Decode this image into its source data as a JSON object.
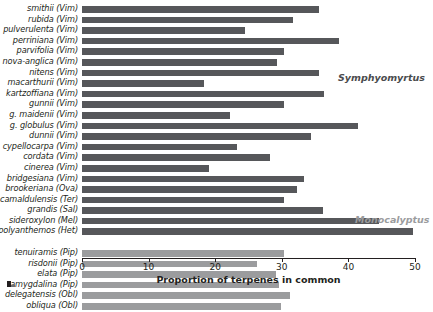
{
  "chart_data": {
    "type": "bar",
    "orientation": "horizontal",
    "title": "",
    "xlabel": "Proportion of terpenes in common",
    "ylabel": "",
    "xlim": [
      0,
      50
    ],
    "xticks": [
      0,
      10,
      20,
      30,
      40,
      50
    ],
    "grid": false,
    "legend": "none",
    "groups": [
      {
        "name": "Symphyomyrtus",
        "color": "#56575a",
        "categories": [
          "smithii (Vim)",
          "rubida (Vim)",
          "pulverulenta (Vim)",
          "perriniana (Vim)",
          "parvifolia (Vim)",
          "nova-anglica (Vim)",
          "nitens (Vim)",
          "macarthurii (Vim)",
          "kartzoffiana (Vim)",
          "gunnii (Vim)",
          "g. maidenii (Vim)",
          "g. globulus (Vim)",
          "dunnii (Vim)",
          "cypellocarpa (Vim)",
          "cordata (Vim)",
          "cinerea (Vim)",
          "bridgesiana (Vim)",
          "brookeriana (Ova)",
          "camaldulensis (Ter)",
          "grandis (Sal)",
          "sideroxylon (Mel)",
          "polyanthemos (Het)"
        ],
        "values": [
          35.6,
          31.7,
          24.5,
          38.6,
          30.3,
          29.3,
          35.6,
          18.3,
          36.3,
          30.3,
          22.2,
          41.4,
          34.4,
          23.3,
          28.2,
          19.1,
          33.3,
          32.3,
          30.3,
          36.2,
          44.6,
          49.7
        ]
      },
      {
        "name": "Monocalyptus",
        "color": "#9b9c9e",
        "categories": [
          "tenuiramis (Pip)",
          "risdonii (Pip)",
          "elata (Pip)",
          "amygdalina (Pip)",
          "delegatensis (Obl)",
          "obliqua (Obl)"
        ],
        "values": [
          30.3,
          26.3,
          29.1,
          29.6,
          31.2,
          29.9
        ]
      }
    ]
  },
  "axis": {
    "tick_labels": [
      "0",
      "10",
      "20",
      "30",
      "40",
      "50"
    ],
    "title": "Proportion of terpenes in common"
  },
  "sections": {
    "symphyomyrtus": "Symphyomyrtus",
    "monocalyptus": "Monocalyptus"
  }
}
